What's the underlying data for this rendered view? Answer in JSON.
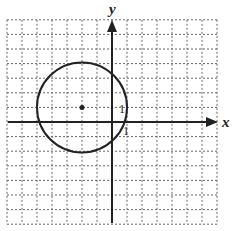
{
  "graph": {
    "x_axis_label": "x",
    "y_axis_label": "y",
    "x_tick_label": "1",
    "y_tick_label": "1",
    "grid": {
      "x_min": -7,
      "x_max": 7,
      "y_min": -7,
      "y_max": 7
    },
    "circle": {
      "center": [
        -2,
        1
      ],
      "radius": 3
    },
    "colors": {
      "grid": "#555555",
      "axis": "#222222",
      "circle": "#222222"
    }
  }
}
